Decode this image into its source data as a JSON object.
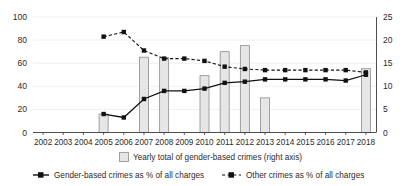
{
  "chart_data": {
    "type": "bar",
    "title": "",
    "xlabel": "",
    "ylabel": "",
    "grid": true,
    "legend_position": "bottom",
    "categories": [
      "2002",
      "2003",
      "2004",
      "2005",
      "2006",
      "2007",
      "2008",
      "2009",
      "2010",
      "2011",
      "2012",
      "2013",
      "2014",
      "2015",
      "2016",
      "2017",
      "2018"
    ],
    "left_axis": {
      "label": "",
      "ticks": [
        "0",
        "20",
        "40",
        "60",
        "80",
        "100"
      ],
      "lim": [
        0,
        100
      ]
    },
    "right_axis": {
      "label": "",
      "ticks": [
        "0",
        "5",
        "10",
        "15",
        "20",
        "25"
      ],
      "lim": [
        0,
        25
      ]
    },
    "series": [
      {
        "name": "Yearly total of gender-based crimes (right axis)",
        "type": "bar",
        "axis": "right",
        "values": [
          null,
          null,
          null,
          4.0,
          null,
          16.3,
          16.2,
          null,
          12.3,
          17.5,
          18.8,
          7.5,
          null,
          null,
          null,
          null,
          13.8
        ]
      },
      {
        "name": "Gender-based crimes as % of all charges",
        "type": "line",
        "axis": "left",
        "style": "solid",
        "values": [
          null,
          null,
          null,
          16,
          13,
          29,
          36,
          36,
          38,
          43,
          44,
          46,
          46,
          46,
          46,
          45,
          50
        ]
      },
      {
        "name": "Other crimes as % of all charges",
        "type": "line",
        "axis": "left",
        "style": "dashed",
        "values": [
          null,
          null,
          null,
          83,
          87,
          71,
          64,
          64,
          62,
          57,
          55,
          54,
          54,
          54,
          54,
          54,
          52
        ]
      }
    ],
    "colors": {
      "bar_fill": "#e6e6e6",
      "bar_stroke": "#8c8c8c",
      "line": "#111111",
      "grid": "#e9e9e9",
      "axis": "#3a3a3a"
    }
  },
  "legend": {
    "bar_entry": "Yearly total of gender-based crimes (right axis)",
    "solid_entry": "Gender-based crimes as % of all charges",
    "dashed_entry": "Other crimes as % of all charges"
  }
}
